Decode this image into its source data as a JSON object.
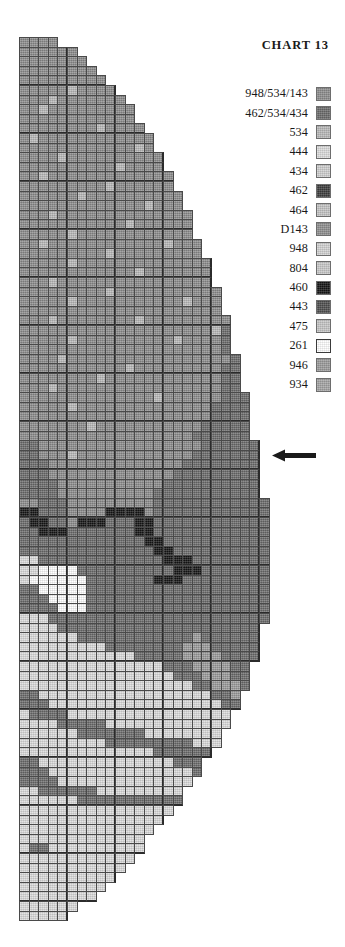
{
  "title": "CHART  13",
  "legend": {
    "entries": [
      {
        "label": "948/534/143",
        "color": "#8c8c8c"
      },
      {
        "label": "462/534/434",
        "color": "#6b6b6b"
      },
      {
        "label": "534",
        "color": "#b9b9b9"
      },
      {
        "label": "444",
        "color": "#dcdcdc"
      },
      {
        "label": "434",
        "color": "#cfcfcf"
      },
      {
        "label": "462",
        "color": "#3c3c3c"
      },
      {
        "label": "464",
        "color": "#c4c4c4"
      },
      {
        "label": "D143",
        "color": "#8f8f8f"
      },
      {
        "label": "948",
        "color": "#d2d2d2"
      },
      {
        "label": "804",
        "color": "#c9c9c9"
      },
      {
        "label": "460",
        "color": "#141414"
      },
      {
        "label": "443",
        "color": "#4e4e4e"
      },
      {
        "label": "475",
        "color": "#c6c6c6"
      },
      {
        "label": "261",
        "color": "#ffffff"
      },
      {
        "label": "946",
        "color": "#9b9b9b"
      },
      {
        "label": "934",
        "color": "#a4a4a4"
      }
    ]
  },
  "marker": {
    "name": "row-indicator-arrow",
    "direction": "left",
    "color": "#1a1a1a"
  },
  "chart_data": {
    "type": "heatmap",
    "title": "CHART  13",
    "xlabel": "",
    "ylabel": "",
    "grid": true,
    "legend_position": "top-right",
    "cell_size": 9.6,
    "heavy_line_interval": 5,
    "columns": 26,
    "rows": 92,
    "palette": {
      "a": "#8c8c8c",
      "b": "#6b6b6b",
      "c": "#b9b9b9",
      "d": "#dcdcdc",
      "e": "#cfcfcf",
      "f": "#3c3c3c",
      "g": "#c4c4c4",
      "h": "#8f8f8f",
      "i": "#d2d2d2",
      "j": "#c9c9c9",
      "k": "#141414",
      "l": "#4e4e4e",
      "m": "#c6c6c6",
      "n": "#ffffff",
      "o": "#9b9b9b",
      "p": "#a4a4a4",
      "_": null
    },
    "row_widths": [
      4,
      6,
      7,
      8,
      9,
      10,
      11,
      12,
      12,
      13,
      14,
      14,
      15,
      15,
      16,
      16,
      17,
      17,
      18,
      18,
      18,
      19,
      19,
      20,
      20,
      20,
      21,
      21,
      21,
      22,
      22,
      22,
      22,
      23,
      23,
      23,
      23,
      24,
      24,
      24,
      24,
      24,
      25,
      25,
      25,
      25,
      25,
      25,
      26,
      26,
      26,
      26,
      26,
      26,
      26,
      26,
      26,
      26,
      26,
      26,
      26,
      25,
      25,
      25,
      25,
      24,
      24,
      24,
      23,
      23,
      22,
      22,
      21,
      21,
      20,
      19,
      19,
      18,
      17,
      17,
      16,
      15,
      14,
      13,
      13,
      12,
      11,
      10,
      9,
      8,
      6,
      5
    ],
    "rows_data": [
      "aaaa",
      "aaaaaa",
      "aaaaaaa",
      "aaaaaaaa",
      "aaaaaaaaa",
      "aaaaacaaaa",
      "aaacaaaaaaa",
      "aacaaaaaaaaa",
      "aaaaaaaaaaaa",
      "aaaaaaaacaaaa",
      "acaaaaaaaaaaaa",
      "aaaaaaaaaaaaca",
      "aaaacaaaaaaaaaa",
      "aaaaaaaaaacaaaa",
      "aacaaaaaaaaaaaaa",
      "aaaaaaaaacaaaaaa",
      "aaaaaacaaaaaaaaaa",
      "aaaaaaaaaaaaacaaa",
      "aaacaaaaaaaaaaaaaa",
      "aaaaaaaaaaacaaaaaa",
      "aaaaacaaaaaaaaaaaa",
      "aacaaaaaaaaaaaacaaa",
      "aaaaaaaaacaaaaaaaaa",
      "aaaaacaaaaaaaaaaaaaa",
      "aaaaaaaaaaaacaaaaaaa",
      "aaacaaaaaaaaaaaaaaaa",
      "aaaaaaaaacaaaaaaaaaaa",
      "aaaaacaaaaaaaaaaacaaa",
      "aaaaaaaaaaaaaaaaaaaaa",
      "aaacaaaaaaaacaaaaaaaaa",
      "aaaaaaaaaaaaaaaaaaaacb",
      "aaaaacaaaaaaaaaacaaaab",
      "aaaaaaaaaaaaaaaaaaaaab",
      "aaaacaaaaaaaaaaaaaaaaab",
      "aaaaaaaaaaacaaaaaaaaabb",
      "aaaaaaaacaaaaaaaaaaaabb",
      "aaacaaaaaaaaaaaaaaaaabb",
      "aaaaaaaaaaaaaacaaaaaabbb",
      "aaaaacaaaaaaaaaaaaaabbbb",
      "aaaaaaaaaaaaaaaaaaaabbbb",
      "aaaaaaacaaaaaaaaaaabbbbb",
      "aaaaaaaaaaaaaaaaaabbbbbb",
      "bbaaaaaaaaaaaaaaaaabbbbbb",
      "bbaaacaaaaaaaaaaaabbbbbbb",
      "bbbaaaaaaaaaaaaaabbbbbbbb",
      "bbbaaaaaaaaaaaaabbbbbbbbb",
      "bbbbaaaaaaaaaaabbbbbbbbbb",
      "bbbbaaaaaaaaaabbbbbbbbbbb",
      "aabbbaaaaaaaaabbbbbbbbbbbb",
      "kkbbbaaaakkkkabbbbbbbbbbbbb",
      "bkkbbakkkbbbkkbbbbbbbbbbbb",
      "bbkkkbbbbbbbkkbbbbbbbbbbbb",
      "bbbbbbbbbbbbbkkbbbbbbbbbbb",
      "bbbbbbbbbbbbbbkkbbbbbbbbbb",
      "ddbbbbbbbbbbbbbkkkbbbbbbbb",
      "ddnnnnbbbbbbbbbbkkkbbbbbbb",
      "dnnnnnnbbbbbbbkkkbbbbbbbbb",
      "bbnnnnnbbbbbbbbbbbbbbbbbbb",
      "bbbnnnnbbbbbbbbbbbbbbbbbbb",
      "bbbbnnnbbbbbbbbbbbbbbbbbbb",
      "dddbbbbbbbbbbbbbbbbbbbbbbb",
      "ddddbbbbbbbbbbbbbbbbbbbbb",
      "ddddddbbbbbbbbbbbbobbbbbb",
      "dddddddddbbbbbbbbooobbbbb",
      "ddddddddddddbbbbboooobbbb",
      "dddddddddddddddbbboooobbb",
      "ddddddddddddddddbbbooobbb",
      "ddddddddddddddddddbbooobb",
      "bbddddddddddddddddddbbooo",
      "bbbddddddddddddddddddbboo",
      "dbbbbddddddddddddddddddbb",
      "ddddbbbbbddddddddddddddbb",
      "ddddddbbbbbbbddddddddddd",
      "dddddddddbbbbbbbbbddddd",
      "ddddddddddddddbbbbbbbbb",
      "bbddddddddddddddbbbbbb",
      "bbbdddddddddddddddbbbb",
      "bbbbddddddddddddddddd",
      "ddbbbbbbddddddddddddd",
      "ddddddbbbbbbbbbbbbbbb",
      "dddddddddddddddd",
      "ddddddddddddddd",
      "dddddddddddddd",
      "ddddddddddddd",
      "dbbdddddddddd",
      "dddddddddddd",
      "ddddddddddd",
      "dddddddddd",
      "ddddddddd",
      "dddddddd",
      "dddddd",
      "ddddd"
    ]
  }
}
